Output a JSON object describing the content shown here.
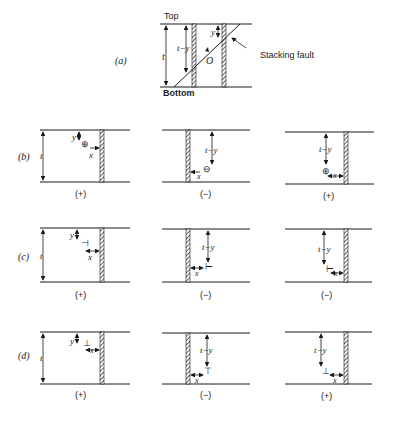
{
  "figure": {
    "panel_a": {
      "label": "(a)",
      "top_label": "Top",
      "bottom_label": "Bottom",
      "thickness_label": "t",
      "depth_label": "t−y",
      "y_label": "y",
      "origin_label": "O",
      "annotation": "Stacking fault"
    },
    "rows": [
      {
        "label": "(b)",
        "cells": [
          {
            "sign": "(+)",
            "depth_label": "y",
            "x_label": "x",
            "thickness_label": "t",
            "marker": "⊕"
          },
          {
            "sign": "(−)",
            "depth_label": "t−y",
            "x_label": "x",
            "marker": "⊖"
          },
          {
            "sign": "(+)",
            "depth_label": "t−y",
            "x_label": "x",
            "marker": "⊕"
          }
        ]
      },
      {
        "label": "(c)",
        "cells": [
          {
            "sign": "(+)",
            "depth_label": "y",
            "x_label": "x",
            "thickness_label": "t",
            "marker": "⊣"
          },
          {
            "sign": "(−)",
            "depth_label": "t−y",
            "x_label": "x",
            "marker": "⊢"
          },
          {
            "sign": "(−)",
            "depth_label": "t−y",
            "x_label": "x",
            "marker": "⊢"
          }
        ]
      },
      {
        "label": "(d)",
        "cells": [
          {
            "sign": "(+)",
            "depth_label": "y",
            "x_label": "x",
            "thickness_label": "t",
            "marker": "⊥"
          },
          {
            "sign": "(−)",
            "depth_label": "t−y",
            "x_label": "x",
            "marker": "⊤"
          },
          {
            "sign": "(+)",
            "depth_label": "t−y",
            "x_label": "x",
            "marker": "⊥"
          }
        ]
      }
    ]
  }
}
